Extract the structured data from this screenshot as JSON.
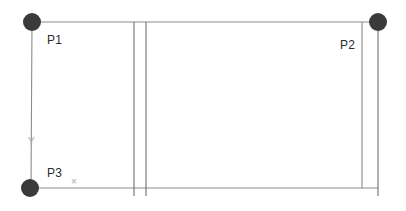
{
  "canvas": {
    "width": 406,
    "height": 211,
    "background_color": "#ffffff"
  },
  "style": {
    "line_color": "#8c8c8c",
    "line_color_dark": "#6e6e6e",
    "node_fill": "#3a3a3a",
    "label_color": "#2b2b2b",
    "axis_marker_color": "#a6a6a6"
  },
  "nodes": [
    {
      "id": "P1",
      "label": "P1",
      "cx": 32,
      "cy": 22,
      "r": 9,
      "label_x": 47,
      "label_y": 34
    },
    {
      "id": "P2",
      "label": "P2",
      "cx": 378,
      "cy": 22,
      "r": 9,
      "label_x": 340,
      "label_y": 39
    },
    {
      "id": "P3",
      "label": "P3",
      "cx": 30,
      "cy": 188,
      "r": 9,
      "label_x": 47,
      "label_y": 167
    }
  ],
  "edges": [
    {
      "id": "top-rail",
      "x1": 32,
      "y1": 22,
      "x2": 378,
      "y2": 22
    },
    {
      "id": "bottom-rail",
      "x1": 30,
      "y1": 188,
      "x2": 378,
      "y2": 188
    },
    {
      "id": "left-post",
      "x1": 32,
      "y1": 22,
      "x2": 31,
      "y2": 188
    },
    {
      "id": "right-post-outer",
      "x1": 378,
      "y1": 22,
      "x2": 378,
      "y2": 196
    },
    {
      "id": "right-post-inner",
      "x1": 362,
      "y1": 22,
      "x2": 362,
      "y2": 188
    },
    {
      "id": "mid-post-left",
      "x1": 134,
      "y1": 22,
      "x2": 134,
      "y2": 196
    },
    {
      "id": "mid-post-right",
      "x1": 146,
      "y1": 22,
      "x2": 146,
      "y2": 196
    }
  ],
  "axis_markers": [
    {
      "id": "y-axis-marker",
      "label": "Y",
      "x": 28,
      "y": 137
    },
    {
      "id": "x-axis-marker",
      "label": "×",
      "x": 71,
      "y": 177
    }
  ]
}
